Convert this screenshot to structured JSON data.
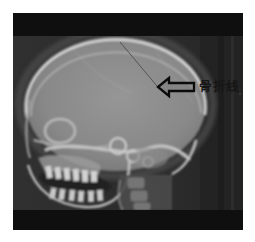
{
  "figure": {
    "name": "skull-lateral-xray",
    "annotation": {
      "label": "骨折线",
      "arrow_icon": "left-block-arrow-icon",
      "arrow_direction": "left"
    },
    "colors": {
      "page_background": "#ffffff",
      "film_border_band": "#0f0f0f",
      "xray_background": "#2d2d2d",
      "right_film_band": "#232323",
      "skull_tissue": "#8f8f8f",
      "bone_highlight": "#d6d6d6",
      "fracture_line": "#4e4e4e",
      "arrow_outline": "#0b0b0b",
      "label_text": "#161616"
    }
  }
}
